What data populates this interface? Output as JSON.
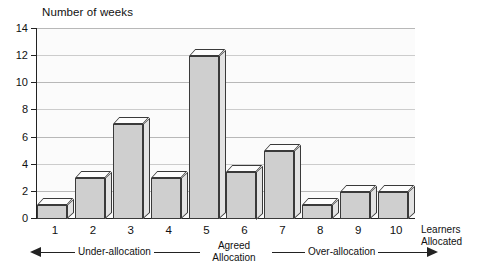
{
  "chart_data": {
    "type": "bar",
    "title": "Number of weeks",
    "xlabel": "Learners Allocated",
    "ylabel": "Number of weeks",
    "categories": [
      "1",
      "2",
      "3",
      "4",
      "5",
      "6",
      "7",
      "8",
      "9",
      "10"
    ],
    "values": [
      1,
      3,
      7,
      3,
      12,
      3.5,
      5,
      1,
      2,
      2
    ],
    "ylim": [
      0,
      14
    ],
    "yticks": [
      0,
      2,
      4,
      6,
      8,
      10,
      12,
      14
    ],
    "ytick_labels": [
      "0",
      "2",
      "4",
      "6",
      "8",
      "10",
      "12",
      "14"
    ],
    "grid": true,
    "legend": false,
    "style": "3d-column",
    "annotations": [
      {
        "text": "Under-allocation",
        "arrow": "left"
      },
      {
        "text": "Agreed Allocation",
        "line1": "Agreed",
        "line2": "Allocation",
        "arrow": "none"
      },
      {
        "text": "Over-allocation",
        "arrow": "right"
      }
    ]
  },
  "colors": {
    "bar_front": "#cfcfcf",
    "bar_top": "#fdfdfd",
    "bar_side": "#e3e3e3",
    "bar_outline": "#3a3a3a",
    "grid": "#b8b8b8",
    "axis": "#222222",
    "plot_background": "#fbfbfb",
    "text": "#111111"
  }
}
